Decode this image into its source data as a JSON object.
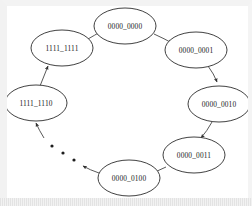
{
  "diagram": {
    "type": "state-transition-cycle",
    "background_color": "#ffffff",
    "node_stroke_color": "#2b2b2b",
    "node_fill_color": "#ffffff",
    "edge_color": "#3a3a3a",
    "label_color": "#222222",
    "nodes": [
      {
        "id": "s0",
        "label": "0000_0000",
        "cx": 125,
        "cy": 26,
        "rx": 31,
        "ry": 18
      },
      {
        "id": "s1",
        "label": "0000_0001",
        "cx": 196,
        "cy": 50,
        "rx": 31,
        "ry": 18
      },
      {
        "id": "s2",
        "label": "0000_0010",
        "cx": 219,
        "cy": 104,
        "rx": 31,
        "ry": 18
      },
      {
        "id": "s3",
        "label": "0000_0011",
        "cx": 194,
        "cy": 155,
        "rx": 31,
        "ry": 18
      },
      {
        "id": "s4",
        "label": "0000_0100",
        "cx": 129,
        "cy": 178,
        "rx": 31,
        "ry": 18
      },
      {
        "id": "sN2",
        "label": "1111_1110",
        "cx": 36,
        "cy": 103,
        "rx": 31,
        "ry": 18
      },
      {
        "id": "sN1",
        "label": "1111_1111",
        "cx": 62,
        "cy": 48,
        "rx": 31,
        "ry": 18
      }
    ],
    "edges": [
      {
        "from": "s0",
        "to": "s1",
        "arrow": true
      },
      {
        "from": "s1",
        "to": "s2",
        "arrow": true
      },
      {
        "from": "s2",
        "to": "s3",
        "arrow": true
      },
      {
        "from": "s3",
        "to": "s4",
        "arrow": true
      },
      {
        "from": "s4",
        "to": "ellipsis",
        "arrow": true
      },
      {
        "from": "ellipsis",
        "to": "sN2",
        "arrow": true
      },
      {
        "from": "sN2",
        "to": "sN1",
        "arrow": true
      },
      {
        "from": "sN1",
        "to": "s0",
        "arrow": true
      }
    ],
    "ellipsis": {
      "label": "...",
      "dots": [
        {
          "cx": 52,
          "cy": 146
        },
        {
          "cx": 63,
          "cy": 153
        },
        {
          "cx": 74,
          "cy": 160
        }
      ]
    }
  }
}
